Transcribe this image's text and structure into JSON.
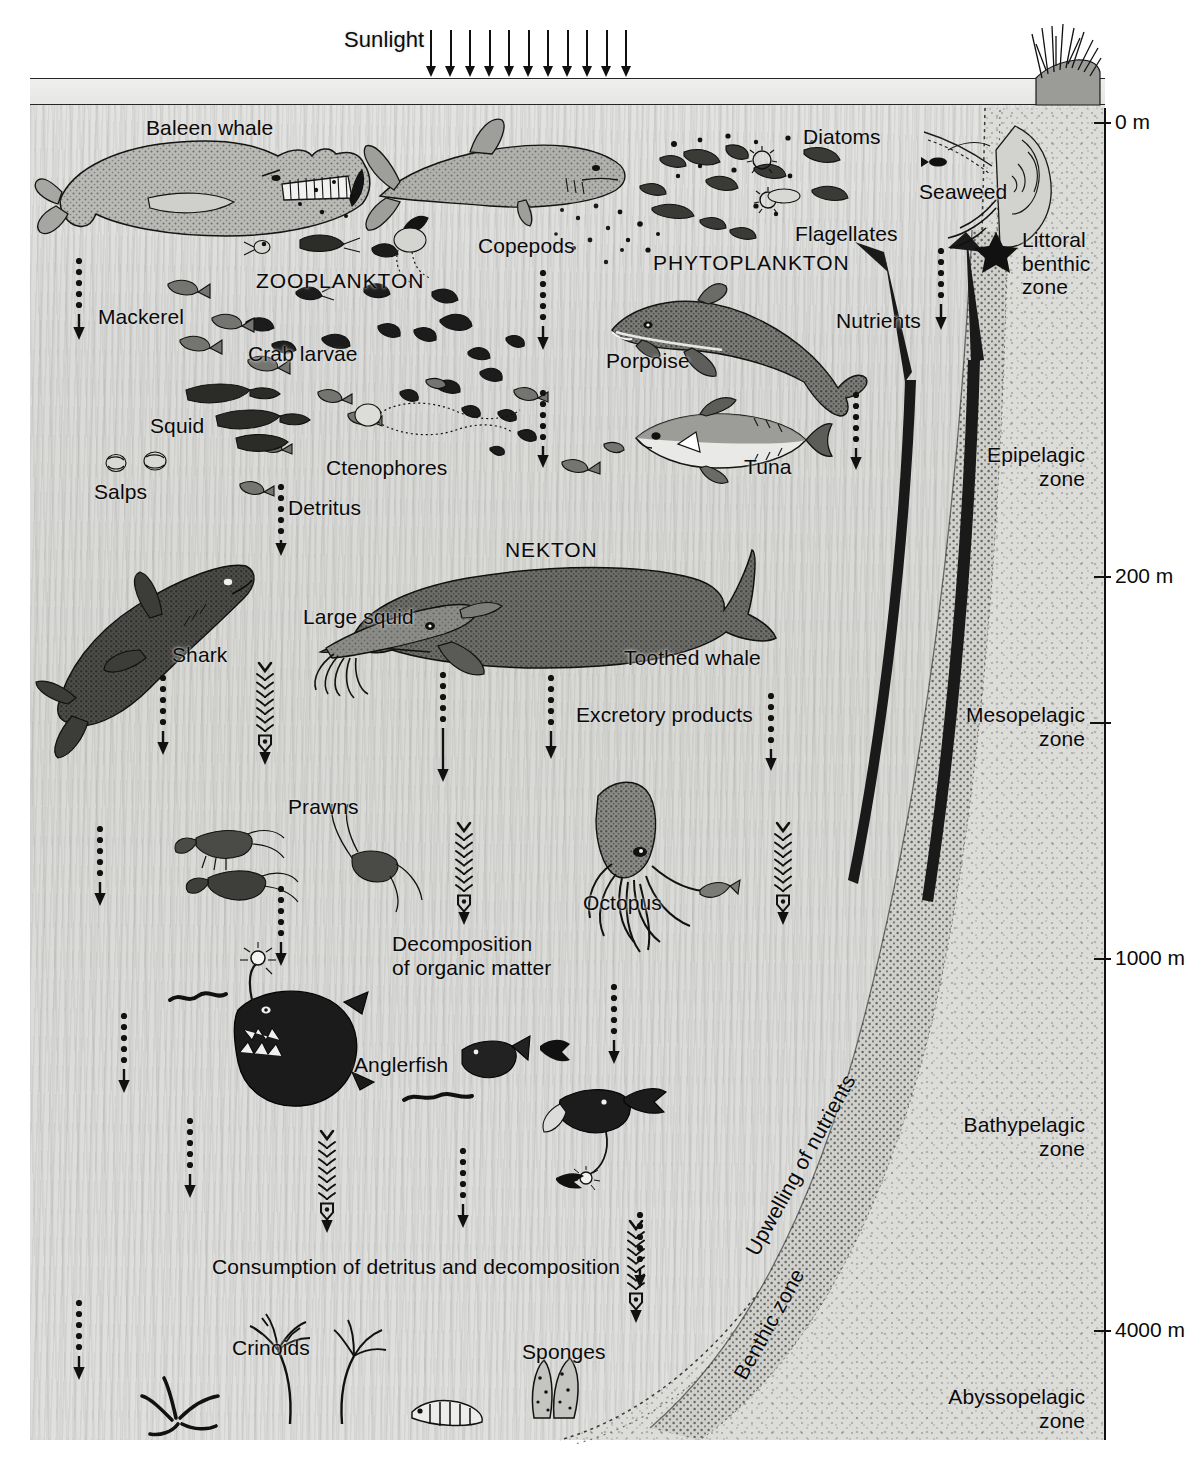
{
  "surface": {
    "sunlight_label": "Sunlight",
    "sunlight_ray_count": 11
  },
  "depth_scale": {
    "axis_label": "depth",
    "ticks": [
      {
        "label": "0 m",
        "y": 122,
        "labeled": true
      },
      {
        "label": "200 m",
        "y": 576,
        "labeled": true
      },
      {
        "label": "",
        "y": 722,
        "labeled": false
      },
      {
        "label": "1000 m",
        "y": 958,
        "labeled": true
      },
      {
        "label": "4000 m",
        "y": 1330,
        "labeled": true
      }
    ]
  },
  "zones": [
    {
      "name": "Littoral\nbenthic\nzone",
      "x": 1022,
      "y": 228,
      "align": "left"
    },
    {
      "name": "Epipelagic\nzone",
      "x": 1085,
      "y": 443,
      "align": "right"
    },
    {
      "name": "Mesopelagic\nzone",
      "x": 1085,
      "y": 703,
      "align": "right"
    },
    {
      "name": "Bathypelagic\nzone",
      "x": 1085,
      "y": 1113,
      "align": "right"
    },
    {
      "name": "Abyssopelagic\nzone",
      "x": 1085,
      "y": 1385,
      "align": "right"
    },
    {
      "name": "Upwelling of nutrients",
      "x": 741,
      "y": 1248,
      "align": "rot"
    },
    {
      "name": "Benthic zone",
      "x": 729,
      "y": 1372,
      "align": "rot"
    }
  ],
  "organisms": [
    {
      "label": "Baleen whale",
      "x": 146,
      "y": 116,
      "size": 21
    },
    {
      "label": "ZOOPLANKTON",
      "x": 256,
      "y": 269,
      "size": 21,
      "caps": true
    },
    {
      "label": "Mackerel",
      "x": 98,
      "y": 305,
      "size": 21
    },
    {
      "label": "Crab larvae",
      "x": 248,
      "y": 342,
      "size": 21
    },
    {
      "label": "Copepods",
      "x": 478,
      "y": 234,
      "size": 21
    },
    {
      "label": "Diatoms",
      "x": 803,
      "y": 125,
      "size": 21
    },
    {
      "label": "Flagellates",
      "x": 795,
      "y": 222,
      "size": 21
    },
    {
      "label": "PHYTOPLANKTON",
      "x": 653,
      "y": 251,
      "size": 21,
      "caps": true
    },
    {
      "label": "Seaweed",
      "x": 919,
      "y": 180,
      "size": 21
    },
    {
      "label": "Nutrients",
      "x": 836,
      "y": 309,
      "size": 21
    },
    {
      "label": "Porpoise",
      "x": 606,
      "y": 349,
      "size": 21
    },
    {
      "label": "Squid",
      "x": 150,
      "y": 414,
      "size": 21
    },
    {
      "label": "Salps",
      "x": 94,
      "y": 480,
      "size": 21
    },
    {
      "label": "Ctenophores",
      "x": 326,
      "y": 456,
      "size": 21
    },
    {
      "label": "Detritus",
      "x": 288,
      "y": 496,
      "size": 21
    },
    {
      "label": "Tuna",
      "x": 744,
      "y": 455,
      "size": 21
    },
    {
      "label": "NEKTON",
      "x": 505,
      "y": 538,
      "size": 21,
      "caps": true
    },
    {
      "label": "Large squid",
      "x": 303,
      "y": 605,
      "size": 21
    },
    {
      "label": "Shark",
      "x": 172,
      "y": 643,
      "size": 21
    },
    {
      "label": "Toothed whale",
      "x": 624,
      "y": 646,
      "size": 21
    },
    {
      "label": "Excretory products",
      "x": 576,
      "y": 703,
      "size": 21
    },
    {
      "label": "Prawns",
      "x": 288,
      "y": 795,
      "size": 21
    },
    {
      "label": "Octopus",
      "x": 583,
      "y": 891,
      "size": 21
    },
    {
      "label": "Decomposition\nof organic matter",
      "x": 392,
      "y": 932,
      "size": 21
    },
    {
      "label": "Anglerfish",
      "x": 354,
      "y": 1053,
      "size": 21
    },
    {
      "label": "Consumption of detritus and decomposition",
      "x": 212,
      "y": 1255,
      "size": 21
    },
    {
      "label": "Crinoids",
      "x": 232,
      "y": 1336,
      "size": 21
    },
    {
      "label": "Sponges",
      "x": 522,
      "y": 1340,
      "size": 21
    }
  ],
  "flow_arrows": {
    "detritus_dotted": [
      {
        "x": 79,
        "y": 258,
        "h": 82
      },
      {
        "x": 281,
        "y": 484,
        "h": 72
      },
      {
        "x": 543,
        "y": 270,
        "h": 80
      },
      {
        "x": 543,
        "y": 390,
        "h": 78
      },
      {
        "x": 856,
        "y": 392,
        "h": 78
      },
      {
        "x": 941,
        "y": 248,
        "h": 82
      },
      {
        "x": 163,
        "y": 675,
        "h": 80
      },
      {
        "x": 443,
        "y": 672,
        "h": 110
      },
      {
        "x": 551,
        "y": 675,
        "h": 84
      },
      {
        "x": 771,
        "y": 693,
        "h": 78
      },
      {
        "x": 100,
        "y": 826,
        "h": 80
      },
      {
        "x": 281,
        "y": 886,
        "h": 80
      },
      {
        "x": 614,
        "y": 984,
        "h": 80
      },
      {
        "x": 124,
        "y": 1013,
        "h": 80
      },
      {
        "x": 190,
        "y": 1118,
        "h": 80
      },
      {
        "x": 463,
        "y": 1148,
        "h": 80
      },
      {
        "x": 79,
        "y": 1300,
        "h": 80
      },
      {
        "x": 640,
        "y": 1212,
        "h": 76
      }
    ],
    "bacterial_feathered": [
      {
        "x": 265,
        "y": 660,
        "h": 105
      },
      {
        "x": 464,
        "y": 820,
        "h": 105
      },
      {
        "x": 783,
        "y": 820,
        "h": 105
      },
      {
        "x": 327,
        "y": 1128,
        "h": 105
      },
      {
        "x": 636,
        "y": 1218,
        "h": 105
      }
    ],
    "upwelling_solid": [
      {
        "name": "nutrient-arrow-left"
      },
      {
        "name": "nutrient-arrow-right"
      }
    ]
  },
  "colors": {
    "ink": "#0a0a0a",
    "water_light": "#e3e3e1",
    "water_dark": "#d6d6d3",
    "seafloor": "#bdbdb9",
    "slope": "#d0d0cc"
  }
}
